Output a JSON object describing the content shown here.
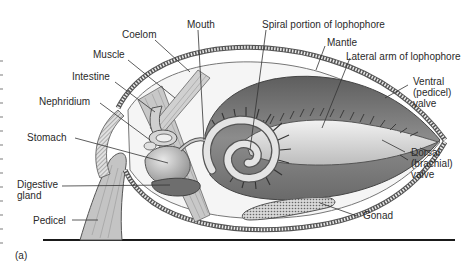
{
  "figure": {
    "panel_label": "(a)",
    "colors": {
      "shell_outline": "#555555",
      "shell_fill": "#e6e6e6",
      "mantle_dark": "#6f6f6f",
      "mantle_mid": "#9a9a9a",
      "organ_light": "#cfcfcf",
      "muscle": "#bfbfbf",
      "substrate": "#1a1a1a",
      "leader_line": "#333333",
      "text": "#2a2a2a"
    },
    "labels": {
      "mouth": "Mouth",
      "coelom": "Coelom",
      "muscle": "Muscle",
      "intestine": "Intestine",
      "nephridium": "Nephridium",
      "stomach": "Stomach",
      "digestive_gland": "Digestive\ngland",
      "pedicel": "Pedicel",
      "spiral_lophophore": "Spiral portion of lophophore",
      "mantle": "Mantle",
      "lateral_arm": "Lateral arm of lophophore",
      "ventral_valve": "Ventral\n(pedicel)\nvalve",
      "dorsal_valve": "Dorsal\n(brachial)\nvalve",
      "gonad": "Gonad"
    }
  }
}
